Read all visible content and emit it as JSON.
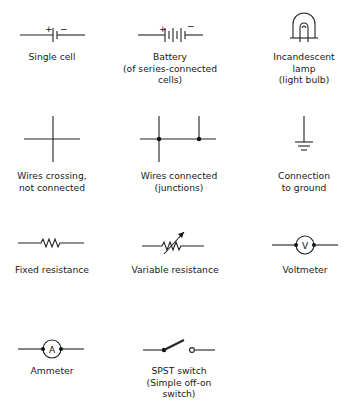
{
  "figure": {
    "symbols": [
      {
        "id": "single-cell",
        "label": "Single cell",
        "polarity": [
          "+",
          "−"
        ]
      },
      {
        "id": "battery",
        "label": "Battery\n(of series-connected\ncells)",
        "polarity": [
          "+",
          "−"
        ]
      },
      {
        "id": "incandescent-lamp",
        "label": "Incandescent\nlamp\n(light bulb)"
      },
      {
        "id": "wires-crossing",
        "label": "Wires crossing,\nnot connected"
      },
      {
        "id": "wires-connected",
        "label": "Wires connected\n(junctions)"
      },
      {
        "id": "ground",
        "label": "Connection\nto ground"
      },
      {
        "id": "fixed-resistance",
        "label": "Fixed resistance"
      },
      {
        "id": "variable-resistance",
        "label": "Variable resistance"
      },
      {
        "id": "voltmeter",
        "label": "Voltmeter",
        "glyph": "V"
      },
      {
        "id": "ammeter",
        "label": "Ammeter",
        "glyph": "A"
      },
      {
        "id": "spst-switch",
        "label": "SPST switch\n(Simple off-on\nswitch)"
      }
    ]
  }
}
